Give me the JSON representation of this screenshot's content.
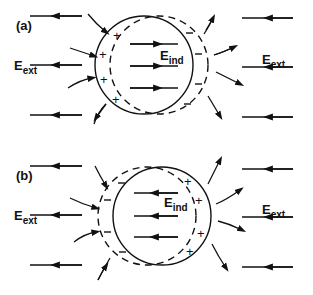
{
  "panels": [
    {
      "id": "a",
      "label": "(a)",
      "solid_circle": {
        "cx": 144,
        "cy": 65,
        "r": 49
      },
      "dashed_circle": {
        "cx": 159,
        "cy": 65,
        "r": 49
      },
      "charge_side_solid": "left",
      "solid_signs": "+",
      "dashed_signs": "-",
      "ext_label": {
        "main": "E",
        "sub": "ext"
      },
      "ind_label": {
        "main": "E",
        "sub": "ind"
      },
      "ind_direction": "right",
      "ext_direction": "left"
    },
    {
      "id": "b",
      "label": "(b)",
      "solid_circle": {
        "cx": 162,
        "cy": 216,
        "r": 49
      },
      "dashed_circle": {
        "cx": 147,
        "cy": 216,
        "r": 49
      },
      "charge_side_solid": "right",
      "solid_signs": "+",
      "dashed_signs": "-",
      "ext_label": {
        "main": "E",
        "sub": "ext"
      },
      "ind_label": {
        "main": "E",
        "sub": "ind"
      },
      "ind_direction": "left",
      "ext_direction": "left"
    }
  ],
  "labels": {
    "a": "(a)",
    "b": "(b)",
    "E": "E",
    "ext": "ext",
    "ind": "ind",
    "plus": "+",
    "minus": "-"
  }
}
